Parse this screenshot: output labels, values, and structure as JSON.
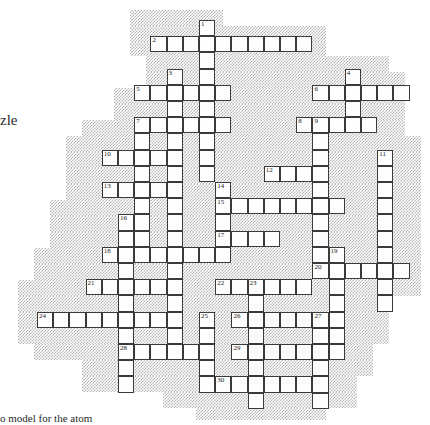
{
  "page": {
    "width": 430,
    "height": 425,
    "background_color": "#ffffff"
  },
  "labels": {
    "left_text": "zle",
    "bottom_text": "o model for the atom"
  },
  "grid": {
    "cell_size": 16.2,
    "origin_x": 37.0,
    "origin_y": 20.0,
    "cell_fill": "#fdfdfd",
    "cell_border": "#3a3a3a",
    "shade_color": "#b4b4b4",
    "columns": 24,
    "rows": 25
  },
  "clue_numbers": [
    1,
    2,
    3,
    4,
    5,
    6,
    7,
    8,
    9,
    10,
    11,
    12,
    13,
    14,
    15,
    16,
    17,
    18,
    19,
    20,
    21,
    22,
    23,
    24,
    25,
    26,
    27,
    28,
    29,
    30
  ],
  "entries": [
    {
      "num": 1,
      "dir": "down",
      "col": 10,
      "row": 0,
      "len": 12
    },
    {
      "num": 2,
      "dir": "across",
      "col": 7,
      "row": 1,
      "len": 10
    },
    {
      "num": 3,
      "dir": "down",
      "col": 8,
      "row": 3,
      "len": 9
    },
    {
      "num": 4,
      "dir": "down",
      "col": 19,
      "row": 3,
      "len": 3
    },
    {
      "num": 5,
      "dir": "across",
      "col": 6,
      "row": 4,
      "len": 6
    },
    {
      "num": 6,
      "dir": "across",
      "col": 17,
      "row": 4,
      "len": 6
    },
    {
      "num": 7,
      "dir": "across",
      "col": 6,
      "row": 6,
      "len": 6
    },
    {
      "num": 8,
      "dir": "across",
      "col": 16,
      "row": 6,
      "len": 6
    },
    {
      "num": 9,
      "dir": "down",
      "col": 17,
      "row": 6,
      "len": 10
    },
    {
      "num": 10,
      "dir": "across",
      "col": 4,
      "row": 8,
      "len": 4
    },
    {
      "num": 11,
      "dir": "down",
      "col": 21,
      "row": 8,
      "len": 8
    },
    {
      "num": 12,
      "dir": "across",
      "col": 14,
      "row": 9,
      "len": 4
    },
    {
      "num": 13,
      "dir": "across",
      "col": 4,
      "row": 10,
      "len": 5
    },
    {
      "num": 14,
      "dir": "down",
      "col": 11,
      "row": 10,
      "len": 4
    },
    {
      "num": 15,
      "dir": "across",
      "col": 11,
      "row": 11,
      "len": 8
    },
    {
      "num": 16,
      "dir": "down",
      "col": 5,
      "row": 12,
      "len": 12
    },
    {
      "num": 17,
      "dir": "across",
      "col": 11,
      "row": 13,
      "len": 4
    },
    {
      "num": 18,
      "dir": "across",
      "col": 4,
      "row": 14,
      "len": 8
    },
    {
      "num": 19,
      "dir": "down",
      "col": 18,
      "row": 14,
      "len": 5
    },
    {
      "num": 20,
      "dir": "across",
      "col": 17,
      "row": 15,
      "len": 6
    },
    {
      "num": 21,
      "dir": "across",
      "col": 3,
      "row": 16,
      "len": 6
    },
    {
      "num": 22,
      "dir": "across",
      "col": 11,
      "row": 16,
      "len": 6
    },
    {
      "num": 23,
      "dir": "down",
      "col": 13,
      "row": 16,
      "len": 9
    },
    {
      "num": 24,
      "dir": "across",
      "col": 0,
      "row": 18,
      "len": 8
    },
    {
      "num": 25,
      "dir": "down",
      "col": 10,
      "row": 18,
      "len": 6
    },
    {
      "num": 26,
      "dir": "across",
      "col": 12,
      "row": 18,
      "len": 7
    },
    {
      "num": 27,
      "dir": "down",
      "col": 17,
      "row": 18,
      "len": 5
    },
    {
      "num": 28,
      "dir": "across",
      "col": 5,
      "row": 20,
      "len": 5
    },
    {
      "num": 29,
      "dir": "across",
      "col": 12,
      "row": 20,
      "len": 6
    },
    {
      "num": 30,
      "dir": "across",
      "col": 11,
      "row": 22,
      "len": 7
    }
  ],
  "cells": [
    {
      "c": 10,
      "r": 0,
      "n": 1
    },
    {
      "c": 7,
      "r": 1,
      "n": 2
    },
    {
      "c": 8,
      "r": 1
    },
    {
      "c": 9,
      "r": 1
    },
    {
      "c": 10,
      "r": 1
    },
    {
      "c": 11,
      "r": 1
    },
    {
      "c": 12,
      "r": 1
    },
    {
      "c": 13,
      "r": 1
    },
    {
      "c": 14,
      "r": 1
    },
    {
      "c": 15,
      "r": 1
    },
    {
      "c": 16,
      "r": 1
    },
    {
      "c": 10,
      "r": 2
    },
    {
      "c": 8,
      "r": 3,
      "n": 3
    },
    {
      "c": 10,
      "r": 3
    },
    {
      "c": 19,
      "r": 3,
      "n": 4
    },
    {
      "c": 6,
      "r": 4,
      "n": 5
    },
    {
      "c": 7,
      "r": 4
    },
    {
      "c": 8,
      "r": 4
    },
    {
      "c": 9,
      "r": 4
    },
    {
      "c": 10,
      "r": 4
    },
    {
      "c": 11,
      "r": 4
    },
    {
      "c": 17,
      "r": 4,
      "n": 6
    },
    {
      "c": 18,
      "r": 4
    },
    {
      "c": 19,
      "r": 4
    },
    {
      "c": 20,
      "r": 4
    },
    {
      "c": 21,
      "r": 4
    },
    {
      "c": 22,
      "r": 4
    },
    {
      "c": 8,
      "r": 5
    },
    {
      "c": 10,
      "r": 5
    },
    {
      "c": 19,
      "r": 5
    },
    {
      "c": 6,
      "r": 6,
      "n": 7
    },
    {
      "c": 7,
      "r": 6
    },
    {
      "c": 8,
      "r": 6
    },
    {
      "c": 9,
      "r": 6
    },
    {
      "c": 10,
      "r": 6
    },
    {
      "c": 11,
      "r": 6
    },
    {
      "c": 16,
      "r": 6,
      "n": 8
    },
    {
      "c": 17,
      "r": 6,
      "n": 9
    },
    {
      "c": 18,
      "r": 6
    },
    {
      "c": 19,
      "r": 6
    },
    {
      "c": 20,
      "r": 6
    },
    {
      "c": 6,
      "r": 7
    },
    {
      "c": 8,
      "r": 7
    },
    {
      "c": 10,
      "r": 7
    },
    {
      "c": 17,
      "r": 7
    },
    {
      "c": 4,
      "r": 8,
      "n": 10
    },
    {
      "c": 5,
      "r": 8
    },
    {
      "c": 6,
      "r": 8
    },
    {
      "c": 7,
      "r": 8
    },
    {
      "c": 8,
      "r": 8
    },
    {
      "c": 10,
      "r": 8
    },
    {
      "c": 17,
      "r": 8
    },
    {
      "c": 21,
      "r": 8,
      "n": 11
    },
    {
      "c": 6,
      "r": 9
    },
    {
      "c": 8,
      "r": 9
    },
    {
      "c": 10,
      "r": 9
    },
    {
      "c": 14,
      "r": 9,
      "n": 12
    },
    {
      "c": 15,
      "r": 9
    },
    {
      "c": 16,
      "r": 9
    },
    {
      "c": 17,
      "r": 9
    },
    {
      "c": 21,
      "r": 9
    },
    {
      "c": 4,
      "r": 10,
      "n": 13
    },
    {
      "c": 5,
      "r": 10
    },
    {
      "c": 6,
      "r": 10
    },
    {
      "c": 7,
      "r": 10
    },
    {
      "c": 8,
      "r": 10
    },
    {
      "c": 11,
      "r": 10,
      "n": 14
    },
    {
      "c": 17,
      "r": 10
    },
    {
      "c": 21,
      "r": 10
    },
    {
      "c": 6,
      "r": 11
    },
    {
      "c": 8,
      "r": 11
    },
    {
      "c": 11,
      "r": 11,
      "n": 15
    },
    {
      "c": 12,
      "r": 11
    },
    {
      "c": 13,
      "r": 11
    },
    {
      "c": 14,
      "r": 11
    },
    {
      "c": 15,
      "r": 11
    },
    {
      "c": 16,
      "r": 11
    },
    {
      "c": 17,
      "r": 11
    },
    {
      "c": 18,
      "r": 11
    },
    {
      "c": 21,
      "r": 11
    },
    {
      "c": 5,
      "r": 12,
      "n": 16
    },
    {
      "c": 6,
      "r": 12
    },
    {
      "c": 8,
      "r": 12
    },
    {
      "c": 11,
      "r": 12
    },
    {
      "c": 17,
      "r": 12
    },
    {
      "c": 21,
      "r": 12
    },
    {
      "c": 5,
      "r": 13
    },
    {
      "c": 6,
      "r": 13
    },
    {
      "c": 8,
      "r": 13
    },
    {
      "c": 11,
      "r": 13,
      "n": 17
    },
    {
      "c": 12,
      "r": 13
    },
    {
      "c": 13,
      "r": 13
    },
    {
      "c": 14,
      "r": 13
    },
    {
      "c": 17,
      "r": 13
    },
    {
      "c": 21,
      "r": 13
    },
    {
      "c": 4,
      "r": 14,
      "n": 18
    },
    {
      "c": 5,
      "r": 14
    },
    {
      "c": 6,
      "r": 14
    },
    {
      "c": 7,
      "r": 14
    },
    {
      "c": 8,
      "r": 14
    },
    {
      "c": 9,
      "r": 14
    },
    {
      "c": 10,
      "r": 14
    },
    {
      "c": 11,
      "r": 14
    },
    {
      "c": 17,
      "r": 14
    },
    {
      "c": 18,
      "r": 14,
      "n": 19
    },
    {
      "c": 21,
      "r": 14
    },
    {
      "c": 5,
      "r": 15
    },
    {
      "c": 8,
      "r": 15
    },
    {
      "c": 17,
      "r": 15,
      "n": 20
    },
    {
      "c": 18,
      "r": 15
    },
    {
      "c": 19,
      "r": 15
    },
    {
      "c": 20,
      "r": 15
    },
    {
      "c": 21,
      "r": 15
    },
    {
      "c": 22,
      "r": 15
    },
    {
      "c": 3,
      "r": 16,
      "n": 21
    },
    {
      "c": 4,
      "r": 16
    },
    {
      "c": 5,
      "r": 16
    },
    {
      "c": 6,
      "r": 16
    },
    {
      "c": 7,
      "r": 16
    },
    {
      "c": 8,
      "r": 16
    },
    {
      "c": 11,
      "r": 16,
      "n": 22
    },
    {
      "c": 12,
      "r": 16
    },
    {
      "c": 13,
      "r": 16,
      "n": 23
    },
    {
      "c": 14,
      "r": 16
    },
    {
      "c": 15,
      "r": 16
    },
    {
      "c": 16,
      "r": 16
    },
    {
      "c": 18,
      "r": 16
    },
    {
      "c": 21,
      "r": 16
    },
    {
      "c": 5,
      "r": 17
    },
    {
      "c": 8,
      "r": 17
    },
    {
      "c": 13,
      "r": 17
    },
    {
      "c": 18,
      "r": 17
    },
    {
      "c": 21,
      "r": 17
    },
    {
      "c": 0,
      "r": 18,
      "n": 24
    },
    {
      "c": 1,
      "r": 18
    },
    {
      "c": 2,
      "r": 18
    },
    {
      "c": 3,
      "r": 18
    },
    {
      "c": 4,
      "r": 18
    },
    {
      "c": 5,
      "r": 18
    },
    {
      "c": 6,
      "r": 18
    },
    {
      "c": 7,
      "r": 18
    },
    {
      "c": 8,
      "r": 18
    },
    {
      "c": 10,
      "r": 18,
      "n": 25
    },
    {
      "c": 12,
      "r": 18,
      "n": 26
    },
    {
      "c": 13,
      "r": 18
    },
    {
      "c": 14,
      "r": 18
    },
    {
      "c": 15,
      "r": 18
    },
    {
      "c": 16,
      "r": 18
    },
    {
      "c": 17,
      "r": 18,
      "n": 27
    },
    {
      "c": 18,
      "r": 18
    },
    {
      "c": 5,
      "r": 19
    },
    {
      "c": 8,
      "r": 19
    },
    {
      "c": 10,
      "r": 19
    },
    {
      "c": 13,
      "r": 19
    },
    {
      "c": 17,
      "r": 19
    },
    {
      "c": 18,
      "r": 19
    },
    {
      "c": 5,
      "r": 20,
      "n": 28
    },
    {
      "c": 6,
      "r": 20
    },
    {
      "c": 7,
      "r": 20
    },
    {
      "c": 8,
      "r": 20
    },
    {
      "c": 9,
      "r": 20
    },
    {
      "c": 10,
      "r": 20
    },
    {
      "c": 12,
      "r": 20,
      "n": 29
    },
    {
      "c": 13,
      "r": 20
    },
    {
      "c": 14,
      "r": 20
    },
    {
      "c": 15,
      "r": 20
    },
    {
      "c": 16,
      "r": 20
    },
    {
      "c": 17,
      "r": 20
    },
    {
      "c": 18,
      "r": 20
    },
    {
      "c": 5,
      "r": 21
    },
    {
      "c": 10,
      "r": 21
    },
    {
      "c": 13,
      "r": 21
    },
    {
      "c": 17,
      "r": 21
    },
    {
      "c": 5,
      "r": 22
    },
    {
      "c": 10,
      "r": 22
    },
    {
      "c": 11,
      "r": 22,
      "n": 30
    },
    {
      "c": 12,
      "r": 22
    },
    {
      "c": 13,
      "r": 22
    },
    {
      "c": 14,
      "r": 22
    },
    {
      "c": 15,
      "r": 22
    },
    {
      "c": 16,
      "r": 22
    },
    {
      "c": 17,
      "r": 22
    },
    {
      "c": 13,
      "r": 23
    },
    {
      "c": 17,
      "r": 23
    }
  ],
  "shade_regions": [
    {
      "x": 130,
      "y": 10,
      "w": 93,
      "h": 16
    },
    {
      "x": 130,
      "y": 26,
      "w": 196,
      "h": 16
    },
    {
      "x": 130,
      "y": 42,
      "w": 196,
      "h": 14
    },
    {
      "x": 146,
      "y": 56,
      "w": 243,
      "h": 16
    },
    {
      "x": 146,
      "y": 72,
      "w": 259,
      "h": 16
    },
    {
      "x": 114,
      "y": 88,
      "w": 291,
      "h": 16
    },
    {
      "x": 114,
      "y": 104,
      "w": 291,
      "h": 16
    },
    {
      "x": 82,
      "y": 120,
      "w": 323,
      "h": 16
    },
    {
      "x": 66,
      "y": 136,
      "w": 355,
      "h": 16
    },
    {
      "x": 66,
      "y": 152,
      "w": 355,
      "h": 16
    },
    {
      "x": 66,
      "y": 168,
      "w": 355,
      "h": 16
    },
    {
      "x": 66,
      "y": 184,
      "w": 355,
      "h": 16
    },
    {
      "x": 50,
      "y": 200,
      "w": 371,
      "h": 16
    },
    {
      "x": 50,
      "y": 216,
      "w": 371,
      "h": 16
    },
    {
      "x": 50,
      "y": 232,
      "w": 371,
      "h": 16
    },
    {
      "x": 34,
      "y": 248,
      "w": 387,
      "h": 16
    },
    {
      "x": 34,
      "y": 264,
      "w": 387,
      "h": 16
    },
    {
      "x": 18,
      "y": 280,
      "w": 403,
      "h": 16
    },
    {
      "x": 18,
      "y": 296,
      "w": 371,
      "h": 16
    },
    {
      "x": 18,
      "y": 312,
      "w": 371,
      "h": 16
    },
    {
      "x": 18,
      "y": 328,
      "w": 371,
      "h": 16
    },
    {
      "x": 34,
      "y": 344,
      "w": 339,
      "h": 16
    },
    {
      "x": 82,
      "y": 360,
      "w": 291,
      "h": 16
    },
    {
      "x": 82,
      "y": 376,
      "w": 275,
      "h": 16
    },
    {
      "x": 163,
      "y": 392,
      "w": 194,
      "h": 16
    },
    {
      "x": 196,
      "y": 408,
      "w": 130,
      "h": 12
    }
  ]
}
